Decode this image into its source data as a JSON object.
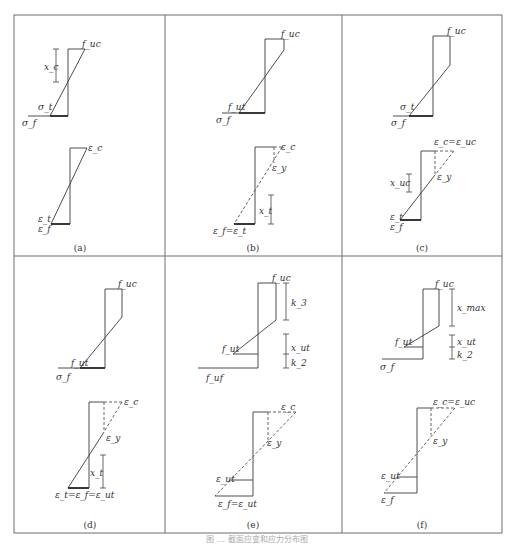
{
  "figure": {
    "caption": "图 … 截面应变和应力分布图",
    "colors": {
      "frame": "#6e6e6e",
      "line": "#3a3a3a",
      "text": "#333333"
    },
    "panels": [
      {
        "id": "a",
        "label": "(a)",
        "stress_labels": {
          "top": "f_uc",
          "dim": "x_c",
          "mid": "σ_t",
          "left": "σ_f"
        },
        "strain_labels": {
          "top": "ε_c",
          "bot1": "ε_t",
          "bot2": "ε_f"
        }
      },
      {
        "id": "b",
        "label": "(b)",
        "stress_labels": {
          "top": "f_uc",
          "mid": "f_ut",
          "left": "σ_f"
        },
        "strain_labels": {
          "top": "ε_c",
          "yield": "ε_y",
          "dim": "x_t",
          "bot": "ε_f=ε_t"
        }
      },
      {
        "id": "c",
        "label": "(c)",
        "stress_labels": {
          "top": "f_uc",
          "mid": "σ_t",
          "left": "σ_f"
        },
        "strain_labels": {
          "top": "ε_c=ε_uc",
          "yield": "ε_y",
          "dim": "x_uc",
          "bot1": "ε_t",
          "bot2": "ε_f"
        }
      },
      {
        "id": "d",
        "label": "(d)",
        "stress_labels": {
          "top": "f_uc",
          "mid": "f_ut",
          "left": "σ_f"
        },
        "strain_labels": {
          "top": "ε_c",
          "yield": "ε_y",
          "dim": "x_t",
          "bot": "ε_t=ε_f=ε_ut"
        }
      },
      {
        "id": "e",
        "label": "(e)",
        "stress_labels": {
          "top": "f_uc",
          "dim_top": "k_3",
          "mid": "f_ut",
          "dim_mid": "x_ut",
          "dim_bot": "k_2",
          "left": "f_uf"
        },
        "strain_labels": {
          "top": "ε_c",
          "yield": "ε_y",
          "mid": "ε_ut",
          "bot": "ε_f=ε_ut"
        }
      },
      {
        "id": "f",
        "label": "(f)",
        "stress_labels": {
          "top": "f_uc",
          "dim_top": "x_max",
          "mid": "f_ut",
          "dim_mid": "x_ut",
          "dim_bot": "k_2",
          "left": "σ_f"
        },
        "strain_labels": {
          "top": "ε_c=ε_uc",
          "yield": "ε_y",
          "mid": "ε_ut",
          "bot": "ε_f"
        }
      }
    ]
  }
}
